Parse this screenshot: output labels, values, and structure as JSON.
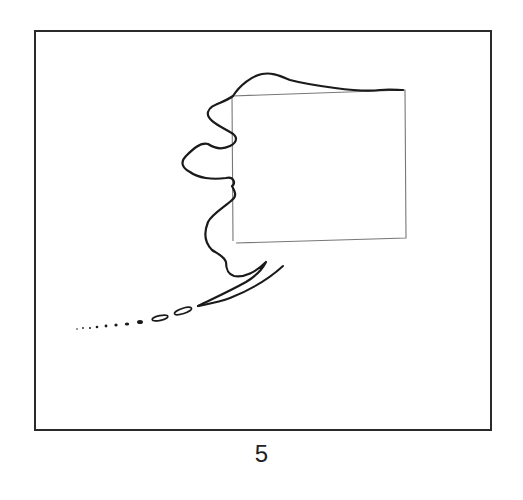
{
  "figure": {
    "label": "5",
    "colors": {
      "frame": "#2a2a2a",
      "coastline": "#1a1a1a",
      "rectangle": "#777777",
      "background": "#ffffff"
    }
  }
}
